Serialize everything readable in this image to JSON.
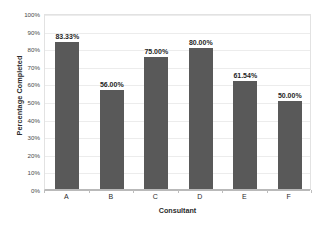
{
  "chart_data": {
    "type": "bar",
    "title": "",
    "xlabel": "Consultant",
    "ylabel": "Percentage Completed",
    "categories": [
      "A",
      "B",
      "C",
      "D",
      "E",
      "F"
    ],
    "values": [
      83.33,
      56.0,
      75.0,
      80.0,
      61.54,
      50.0
    ],
    "data_labels": [
      "83.33%",
      "56.00%",
      "75.00%",
      "80.00%",
      "61.54%",
      "50.00%"
    ],
    "ylim": [
      0,
      100
    ],
    "ytick_values": [
      0,
      10,
      20,
      30,
      40,
      50,
      60,
      70,
      80,
      90,
      100
    ],
    "ytick_labels": [
      "0%",
      "10%",
      "20%",
      "30%",
      "40%",
      "50%",
      "60%",
      "70%",
      "80%",
      "90%",
      "100%"
    ],
    "grid": true,
    "legend": false,
    "legend_position": "none",
    "series": [
      {
        "name": "Percentage Completed",
        "values": [
          83.33,
          56.0,
          75.0,
          80.0,
          61.54,
          50.0
        ]
      }
    ],
    "colors": {
      "bar": "#595959",
      "gridline": "#ececec",
      "axis": "#b9b9b9",
      "plot_border": "#e2e2e2",
      "label_text": "#1f1f1f",
      "tick_text": "#4a4a4a",
      "background": "#ffffff"
    }
  }
}
